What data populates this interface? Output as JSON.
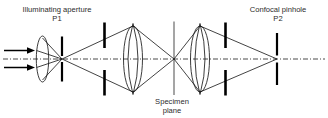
{
  "figure": {
    "background_color": "#ffffff",
    "line_color": "#141414",
    "text_color": "#2b2b2b"
  },
  "labels": {
    "left_title": "Illuminating aperture",
    "left_point": "P1",
    "right_title": "Confocal pinhole",
    "right_point": "P2",
    "center_title": "Specimen",
    "center_subtitle": "plane"
  },
  "elements": {
    "source_arrows": "incoming-light-rays",
    "collector_lens": "condenser-lens",
    "pinhole_p1": "illuminating-aperture-pinhole",
    "aperture_stop_left": "left-aperture-stop",
    "objective_lens_left": "left-objective-lens",
    "specimen_plane": "specimen-plane-line",
    "objective_lens_right": "right-objective-lens",
    "aperture_stop_right": "right-aperture-stop",
    "pinhole_p2": "confocal-pinhole",
    "optical_axis": "optical-axis-dash-dot"
  }
}
